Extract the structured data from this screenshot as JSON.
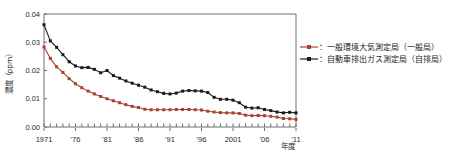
{
  "chart_data": {
    "type": "line",
    "title": "",
    "xlabel": "年度",
    "ylabel": "濃度（ppm）",
    "ylim": [
      0.0,
      0.04
    ],
    "grid": false,
    "legend_position": "right",
    "y_ticks": [
      "0.00",
      "0.01",
      "0.02",
      "0.03",
      "0.04"
    ],
    "y_tick_values": [
      0.0,
      0.01,
      0.02,
      0.03,
      0.04
    ],
    "x_tick_labels": [
      "1971",
      "'76",
      "'81",
      "'86",
      "'91",
      "'96",
      "2001",
      "'06",
      "'11"
    ],
    "x_tick_values": [
      1971,
      1976,
      1981,
      1986,
      1991,
      1996,
      2001,
      2006,
      2011
    ],
    "x_axis_suffix": "年度",
    "x": [
      1971,
      1972,
      1973,
      1974,
      1975,
      1976,
      1977,
      1978,
      1979,
      1980,
      1981,
      1982,
      1983,
      1984,
      1985,
      1986,
      1987,
      1988,
      1989,
      1990,
      1991,
      1992,
      1993,
      1994,
      1995,
      1996,
      1997,
      1998,
      1999,
      2000,
      2001,
      2002,
      2003,
      2004,
      2005,
      2006,
      2007,
      2008,
      2009,
      2010,
      2011
    ],
    "series": [
      {
        "name": "一般環境大気測定局（一般局）",
        "short_name": "一般局",
        "color": "#a8402c",
        "marker": "square",
        "values": [
          0.0283,
          0.0243,
          0.0213,
          0.0193,
          0.0171,
          0.0153,
          0.0139,
          0.0127,
          0.0117,
          0.0108,
          0.01,
          0.0093,
          0.0086,
          0.0079,
          0.0073,
          0.0069,
          0.0063,
          0.0061,
          0.0061,
          0.0061,
          0.0061,
          0.0062,
          0.0062,
          0.0062,
          0.0061,
          0.006,
          0.0056,
          0.0053,
          0.0051,
          0.005,
          0.005,
          0.0048,
          0.0042,
          0.004,
          0.0041,
          0.004,
          0.0038,
          0.0035,
          0.003,
          0.0029,
          0.0027
        ]
      },
      {
        "name": "自動車排出ガス測定局（自排局）",
        "short_name": "自排局",
        "color": "#1a1a1a",
        "marker": "square",
        "values": [
          0.0362,
          0.0305,
          0.0282,
          0.0256,
          0.0231,
          0.0216,
          0.021,
          0.0211,
          0.0204,
          0.0192,
          0.02,
          0.0182,
          0.0173,
          0.0163,
          0.0155,
          0.0148,
          0.0141,
          0.0131,
          0.0125,
          0.0119,
          0.0117,
          0.012,
          0.0127,
          0.0129,
          0.0128,
          0.0127,
          0.0122,
          0.0105,
          0.0098,
          0.0098,
          0.0095,
          0.0086,
          0.007,
          0.0067,
          0.0068,
          0.0062,
          0.0058,
          0.0053,
          0.005,
          0.0052,
          0.005
        ]
      }
    ],
    "legend": [
      {
        "label": "：一般環境大気測定局（一般局）",
        "color": "#a8402c"
      },
      {
        "label": "：自動車排出ガス測定局（自排局）",
        "color": "#1a1a1a"
      }
    ]
  }
}
